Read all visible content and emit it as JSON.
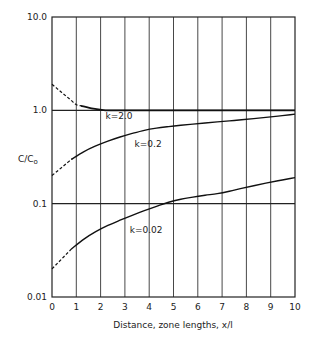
{
  "chart_data": {
    "type": "line",
    "title": "",
    "xlabel": "Distance, zone lengths, x/l",
    "ylabel": "C/C₀",
    "ylabel_main": "C/C",
    "ylabel_sub": "o",
    "xscale": "linear",
    "yscale": "log",
    "xlim": [
      0,
      10
    ],
    "ylim": [
      0.01,
      10.0
    ],
    "x_ticks": [
      "0",
      "1",
      "2",
      "3",
      "4",
      "5",
      "6",
      "7",
      "8",
      "9",
      "10"
    ],
    "y_ticks": [
      "10.0",
      "1.0",
      "0.1",
      "0.01"
    ],
    "grid": {
      "vertical": true,
      "horizontal_at": [
        1.0,
        0.1
      ]
    },
    "legend": null,
    "x": [
      0,
      1,
      2,
      3,
      4,
      5,
      6,
      7,
      8,
      9,
      10
    ],
    "series": [
      {
        "name": "k=2.0",
        "label": "k=2.0",
        "values": [
          1.9,
          1.15,
          1.0,
          1.0,
          1.0,
          1.0,
          1.0,
          1.0,
          1.0,
          1.0,
          1.0
        ],
        "dashed_until_x": 1.2,
        "line_weight": "heavy"
      },
      {
        "name": "k=0.2",
        "label": "k=0.2",
        "values": [
          0.2,
          0.33,
          0.44,
          0.54,
          0.63,
          0.68,
          0.72,
          0.76,
          0.8,
          0.85,
          0.91
        ],
        "dashed_until_x": 0.8
      },
      {
        "name": "k=0.02",
        "label": "k=0.02",
        "values": [
          0.02,
          0.037,
          0.054,
          0.07,
          0.088,
          0.108,
          0.12,
          0.13,
          0.15,
          0.17,
          0.19
        ],
        "dashed_until_x": 0.8
      }
    ],
    "annotations": [
      {
        "text": "k=2.0",
        "x": 2.2,
        "y": 0.8
      },
      {
        "text": "k=0.2",
        "x": 3.4,
        "y": 0.4
      },
      {
        "text": "k=0.02",
        "x": 3.2,
        "y": 0.048
      }
    ]
  }
}
